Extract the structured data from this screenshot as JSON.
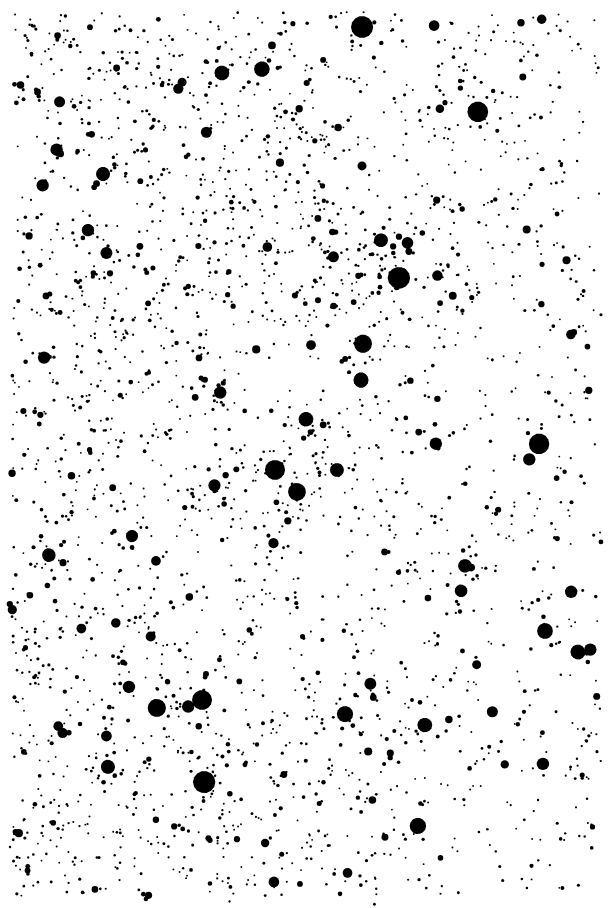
{
  "figure": {
    "kind": "astronomical-star-field",
    "medium": "photographic-plate-halftone",
    "caption": "",
    "width_px": 611,
    "height_px": 908,
    "background_color": "#ffffff",
    "star_color": "#000000",
    "threshold": "bilevel"
  },
  "field": {
    "left_px": 12,
    "top_px": 12,
    "right_px": 601,
    "bottom_px": 896,
    "density_gradient": "denser-left-center, sparser-right",
    "approx_star_count": 2400,
    "seed": 20240917,
    "size_distribution": {
      "min_radius_px": 0.9,
      "typical_radius_px": 2.0,
      "max_radius_px": 11.5,
      "power_law_exponent": 2.6
    },
    "density_field": {
      "base": 1.0,
      "x_falloff": 0.55,
      "y_variation": 0.18,
      "clumpiness": 0.45,
      "clump_scale_px": 90
    }
  },
  "bright_stars": [
    {
      "x": 362,
      "y": 27,
      "r": 11.5
    },
    {
      "x": 478,
      "y": 112,
      "r": 10.5
    },
    {
      "x": 262,
      "y": 69,
      "r": 8.0
    },
    {
      "x": 222,
      "y": 73,
      "r": 7.5
    },
    {
      "x": 103,
      "y": 174,
      "r": 7.5
    },
    {
      "x": 88,
      "y": 230,
      "r": 6.5
    },
    {
      "x": 381,
      "y": 240,
      "r": 7.0
    },
    {
      "x": 399,
      "y": 278,
      "r": 11.0
    },
    {
      "x": 363,
      "y": 344,
      "r": 9.5
    },
    {
      "x": 361,
      "y": 380,
      "r": 8.0
    },
    {
      "x": 306,
      "y": 419,
      "r": 7.5
    },
    {
      "x": 275,
      "y": 470,
      "r": 10.0
    },
    {
      "x": 297,
      "y": 492,
      "r": 9.0
    },
    {
      "x": 539,
      "y": 444,
      "r": 10.5
    },
    {
      "x": 337,
      "y": 470,
      "r": 7.0
    },
    {
      "x": 465,
      "y": 566,
      "r": 7.0
    },
    {
      "x": 545,
      "y": 631,
      "r": 8.0
    },
    {
      "x": 578,
      "y": 652,
      "r": 7.5
    },
    {
      "x": 202,
      "y": 700,
      "r": 10.0
    },
    {
      "x": 157,
      "y": 708,
      "r": 9.0
    },
    {
      "x": 345,
      "y": 714,
      "r": 8.0
    },
    {
      "x": 425,
      "y": 725,
      "r": 7.5
    },
    {
      "x": 204,
      "y": 782,
      "r": 11.0
    },
    {
      "x": 108,
      "y": 767,
      "r": 7.0
    },
    {
      "x": 418,
      "y": 826,
      "r": 8.5
    },
    {
      "x": 49,
      "y": 555,
      "r": 7.0
    },
    {
      "x": 132,
      "y": 536,
      "r": 6.5
    },
    {
      "x": 461,
      "y": 591,
      "r": 6.5
    }
  ],
  "labels": {
    "figure_name": "star-field-plate"
  }
}
